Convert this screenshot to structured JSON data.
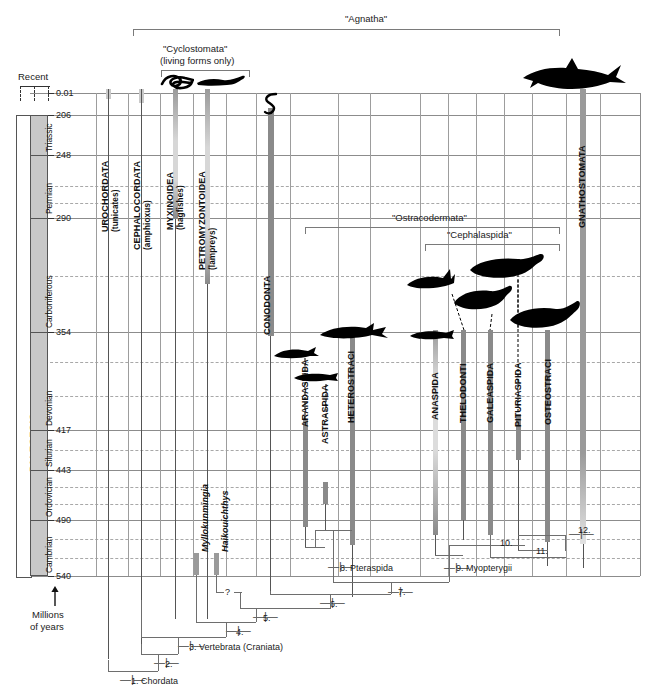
{
  "figure": {
    "title_top": "\"Agnatha\"",
    "axis_caption_line1": "Millions",
    "axis_caption_line2": "of years",
    "recent_label": "Recent"
  },
  "brackets": [
    {
      "id": "agnatha",
      "label": "\"Agnatha\""
    },
    {
      "id": "cyclostomata",
      "label": "\"Cyclostomata\"",
      "sub": "(living forms only)"
    },
    {
      "id": "ostracodermata",
      "label": "\"Ostracodermata\""
    },
    {
      "id": "cephalaspida",
      "label": "\"Cephalaspida\""
    }
  ],
  "era": {
    "name": "PALEOZOIC"
  },
  "periods": [
    {
      "name": "Triassic"
    },
    {
      "name": "Permian"
    },
    {
      "name": "Carboniferous"
    },
    {
      "name": "Devonian"
    },
    {
      "name": "Silurian"
    },
    {
      "name": "Ordovician"
    },
    {
      "name": "Cambrian"
    }
  ],
  "time_ticks": [
    "0.01",
    "206",
    "248",
    "290",
    "354",
    "417",
    "443",
    "490",
    "540"
  ],
  "taxa": [
    {
      "name": "UROCHORDATA",
      "common": "(tunicates)"
    },
    {
      "name": "CEPHALOCORDATA",
      "common": "(amphioxus)"
    },
    {
      "name": "MYXINOIDEA",
      "common": "(hagfishes)"
    },
    {
      "name": "PETROMYZONTOIDEA",
      "common": "(lampreys)"
    },
    {
      "name": "CONODONTA",
      "common": ""
    },
    {
      "name": "ARANDASPIDA",
      "common": ""
    },
    {
      "name": "ASTRASPIDA",
      "common": ""
    },
    {
      "name": "HETEROSTRACI",
      "common": ""
    },
    {
      "name": "ANASPIDA",
      "common": ""
    },
    {
      "name": "THELODONTI",
      "common": ""
    },
    {
      "name": "GALEASPIDA",
      "common": ""
    },
    {
      "name": "PITURIASPIDA",
      "common": ""
    },
    {
      "name": "OSTEOSTRACI",
      "common": ""
    },
    {
      "name": "GNATHOSTOMATA",
      "common": ""
    }
  ],
  "fossil_genera": [
    {
      "name": "Myllokunmingia"
    },
    {
      "name": "Haikouichthys"
    }
  ],
  "nodes": [
    {
      "num": "1.",
      "label": "1. Chordata"
    },
    {
      "num": "2.",
      "label": "2."
    },
    {
      "num": "3.",
      "label": "3. Vertebrata (Craniata)"
    },
    {
      "num": "4.",
      "label": "4."
    },
    {
      "num": "5.",
      "label": "5."
    },
    {
      "num": "6.",
      "label": "6."
    },
    {
      "num": "7.",
      "label": "7."
    },
    {
      "num": "8.",
      "label": "8. Pteraspida"
    },
    {
      "num": "9.",
      "label": "9. Myopterygii"
    },
    {
      "num": "10.",
      "label": "10."
    },
    {
      "num": "11.",
      "label": "11."
    },
    {
      "num": "12.",
      "label": "12."
    },
    {
      "num": "?",
      "label": "?"
    }
  ],
  "colors": {
    "grid_solid": "#8c8c8c",
    "grid_dashed": "#a8a8a8",
    "range_bar": "#9a9a9a",
    "range_bar_light": "#c9c9c9",
    "period_fill": "#c8c8c8",
    "tree_line": "#6e6e6e",
    "silhouette": "#000000"
  }
}
